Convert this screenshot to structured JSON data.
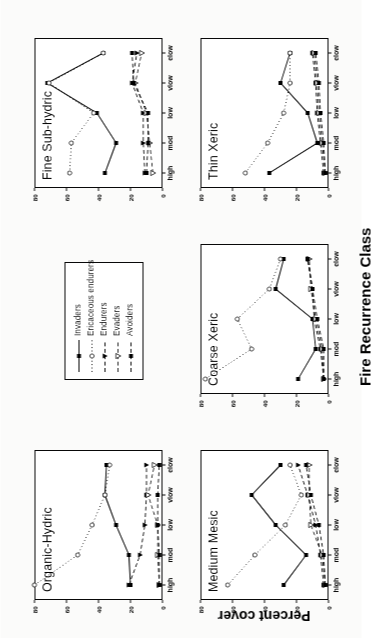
{
  "figure": {
    "y_axis_title": "Percent cover",
    "x_axis_title": "Fire Recurrence Class"
  },
  "legend": {
    "entries": [
      {
        "label": "Invaders",
        "marker": "filled-square",
        "dash": "solid"
      },
      {
        "label": "Ericaceous endurers",
        "marker": "open-circle",
        "dash": "dotted"
      },
      {
        "label": "Endurers",
        "marker": "filled-triangle-down",
        "dash": "dashed"
      },
      {
        "label": "Evaders",
        "marker": "open-triangle-down",
        "dash": "dashed"
      },
      {
        "label": "Avoiders",
        "marker": "filled-square",
        "dash": "dashed"
      }
    ]
  },
  "chart_data": {
    "type": "line",
    "title": "",
    "xlabel": "Fire Recurrence Class",
    "ylabel": "Percent cover",
    "categories": [
      "high",
      "mod",
      "low",
      "vlow",
      "elow"
    ],
    "ylim": [
      0,
      80
    ],
    "yticks": [
      0,
      20,
      40,
      60,
      80
    ],
    "grid": false,
    "legend_position": "center",
    "panels": [
      {
        "title": "Organic-Hydric",
        "series": [
          {
            "name": "Invaders",
            "values": [
              20,
              21,
              29,
              36,
              35
            ]
          },
          {
            "name": "Ericaceous endurers",
            "values": [
              80,
              53,
              44,
              36,
              33
            ]
          },
          {
            "name": "Endurers",
            "values": [
              21,
              14,
              11,
              10,
              10
            ]
          },
          {
            "name": "Evaders",
            "values": [
              2,
              3,
              3,
              9,
              5
            ]
          },
          {
            "name": "Avoiders",
            "values": [
              2,
              2,
              3,
              3,
              2
            ]
          }
        ]
      },
      {
        "title": "Fine Sub-hydric",
        "series": [
          {
            "name": "Invaders",
            "values": [
              36,
              29,
              41,
              72,
              37
            ]
          },
          {
            "name": "Ericaceous endurers",
            "values": [
              58,
              57,
              43,
              71,
              37
            ]
          },
          {
            "name": "Endurers",
            "values": [
              11,
              12,
              12,
              19,
              16
            ]
          },
          {
            "name": "Evaders",
            "values": [
              6,
              8,
              10,
              17,
              13
            ]
          },
          {
            "name": "Avoiders",
            "values": [
              10,
              9,
              9,
              18,
              19
            ]
          }
        ]
      },
      {
        "title": "Coarse Xeric",
        "series": [
          {
            "name": "Invaders",
            "values": [
              19,
              8,
              10,
              33,
              28
            ]
          },
          {
            "name": "Ericaceous endurers",
            "values": [
              77,
              48,
              57,
              37,
              30
            ]
          },
          {
            "name": "Endurers",
            "values": [
              3,
              5,
              9,
              10,
              13
            ]
          },
          {
            "name": "Evaders",
            "values": [
              3,
              4,
              8,
              11,
              12
            ]
          },
          {
            "name": "Avoiders",
            "values": [
              3,
              3,
              7,
              10,
              13
            ]
          }
        ]
      },
      {
        "title": "Medium Mesic",
        "series": [
          {
            "name": "Invaders",
            "values": [
              28,
              14,
              33,
              48,
              30
            ]
          },
          {
            "name": "Ericaceous endurers",
            "values": [
              63,
              46,
              27,
              17,
              24
            ]
          },
          {
            "name": "Endurers",
            "values": [
              3,
              5,
              8,
              13,
              19
            ]
          },
          {
            "name": "Evaders",
            "values": [
              2,
              4,
              11,
              12,
              12
            ]
          },
          {
            "name": "Avoiders",
            "values": [
              2,
              3,
              6,
              11,
              14
            ]
          }
        ]
      },
      {
        "title": "Thin Xeric",
        "series": [
          {
            "name": "Invaders",
            "values": [
              37,
              7,
              13,
              30,
              24
            ]
          },
          {
            "name": "Ericaceous endurers",
            "values": [
              52,
              38,
              28,
              24,
              24
            ]
          },
          {
            "name": "Endurers",
            "values": [
              3,
              5,
              7,
              8,
              10
            ]
          },
          {
            "name": "Evaders",
            "values": [
              2,
              4,
              6,
              7,
              9
            ]
          },
          {
            "name": "Avoiders",
            "values": [
              2,
              3,
              5,
              6,
              8
            ]
          }
        ]
      }
    ]
  }
}
